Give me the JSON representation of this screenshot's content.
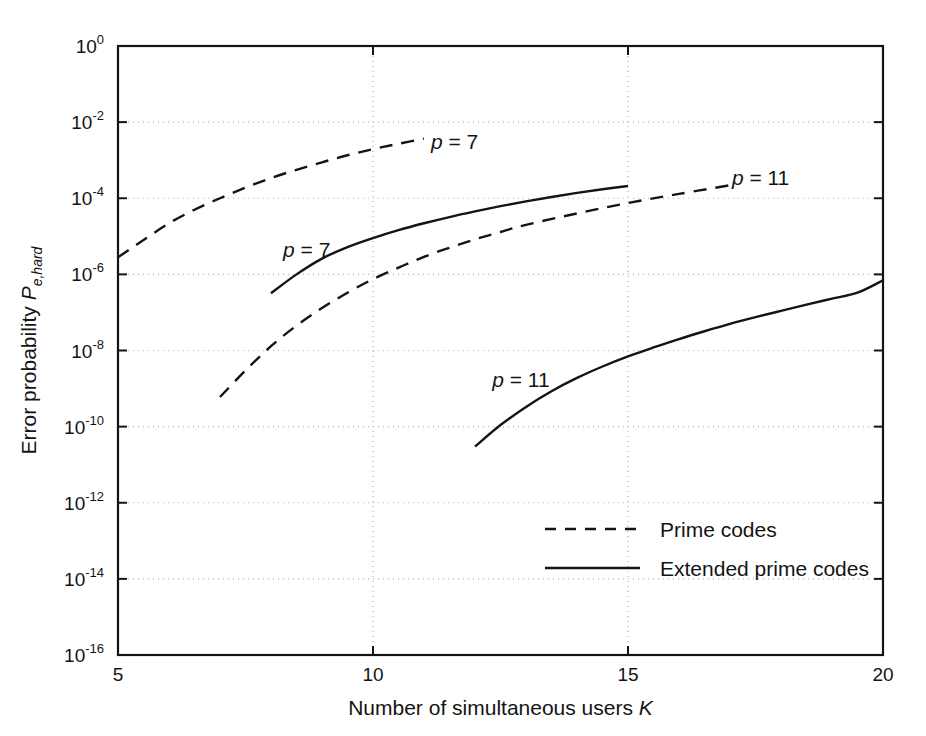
{
  "chart_data": {
    "type": "line",
    "title": "",
    "xlabel": "Number of simultaneous users   K",
    "xlabel_text": "Number of simultaneous users",
    "xlabel_var": "K",
    "ylabel_text": "Error probability",
    "ylabel_var": "P",
    "ylabel_sub": "e,hard",
    "xscale": "linear",
    "yscale": "log",
    "xlim": [
      5,
      20
    ],
    "ylim": [
      1e-16,
      1
    ],
    "grid": true,
    "grid_style": "dotted",
    "xticks": [
      5,
      10,
      15,
      20
    ],
    "xticklabels": [
      "5",
      "10",
      "15",
      "20"
    ],
    "yticks": [
      1,
      0.01,
      0.0001,
      1e-06,
      1e-08,
      1e-10,
      1e-12,
      1e-14,
      1e-16
    ],
    "yticklabels": [
      "10^0",
      "10^-2",
      "10^-4",
      "10^-6",
      "10^-8",
      "10^-10",
      "10^-12",
      "10^-14",
      "10^-16"
    ],
    "ytick_mantissa": "10",
    "ytick_exponents": [
      "0",
      "-2",
      "-4",
      "-6",
      "-8",
      "-10",
      "-12",
      "-14",
      "-16"
    ],
    "legend_position": "center",
    "series": [
      {
        "name": "Prime codes, p = 7",
        "style": "dashed",
        "annotation": "p = 7",
        "annotation_x": 11.6,
        "annotation_y": 0.003,
        "x": [
          5,
          5.5,
          6,
          6.5,
          7,
          7.5,
          8,
          8.5,
          9,
          9.5,
          10,
          10.5,
          11
        ],
        "y": [
          2.8e-06,
          8e-06,
          2.2e-05,
          5e-05,
          0.0001,
          0.00019,
          0.00034,
          0.00056,
          0.00088,
          0.00135,
          0.00195,
          0.0027,
          0.0037
        ]
      },
      {
        "name": "Extended prime codes, p = 7",
        "style": "solid",
        "annotation": "p = 7",
        "annotation_x": 8.7,
        "annotation_y": 4.5e-06,
        "x": [
          8,
          8.5,
          9,
          9.5,
          10,
          10.5,
          11,
          11.5,
          12,
          12.5,
          13,
          13.5,
          14,
          14.5,
          15
        ],
        "y": [
          3.2e-07,
          1e-06,
          2.6e-06,
          5.2e-06,
          9e-06,
          1.45e-05,
          2.2e-05,
          3.2e-05,
          4.5e-05,
          6.2e-05,
          8.3e-05,
          0.000108,
          0.000138,
          0.000172,
          0.00021
        ]
      },
      {
        "name": "Prime codes, p = 11",
        "style": "dashed",
        "annotation": "p = 11",
        "annotation_x": 17.6,
        "annotation_y": 0.00034,
        "x": [
          7,
          7.5,
          8,
          8.5,
          9,
          9.5,
          10,
          10.5,
          11,
          11.5,
          12,
          12.5,
          13,
          14,
          15,
          16,
          17
        ],
        "y": [
          6e-10,
          3e-09,
          1.3e-08,
          4.5e-08,
          1.3e-07,
          3.3e-07,
          7.5e-07,
          1.5e-06,
          2.9e-06,
          5e-06,
          8.3e-06,
          1.3e-05,
          2e-05,
          4e-05,
          7.5e-05,
          0.00013,
          0.00022
        ]
      },
      {
        "name": "Extended prime codes, p = 11",
        "style": "solid",
        "annotation": "p = 11",
        "annotation_x": 12.9,
        "annotation_y": 1.7e-09,
        "x": [
          12,
          12.5,
          13,
          13.5,
          14,
          14.5,
          15,
          15.5,
          16,
          16.5,
          17,
          17.5,
          18,
          18.5,
          19,
          19.5,
          20
        ],
        "y": [
          3e-11,
          1.1e-10,
          3.3e-10,
          8.5e-10,
          1.9e-09,
          3.8e-09,
          7e-09,
          1.2e-08,
          2e-08,
          3.2e-08,
          5e-08,
          7.5e-08,
          1.1e-07,
          1.6e-07,
          2.3e-07,
          3.3e-07,
          7e-07
        ]
      }
    ],
    "legend": [
      {
        "label": "Prime codes",
        "style": "dashed"
      },
      {
        "label": "Extended prime codes",
        "style": "solid"
      }
    ],
    "colors": {
      "line": "#141414",
      "axis": "#141414",
      "grid": "#b4b4b4",
      "background": "#ffffff"
    }
  }
}
